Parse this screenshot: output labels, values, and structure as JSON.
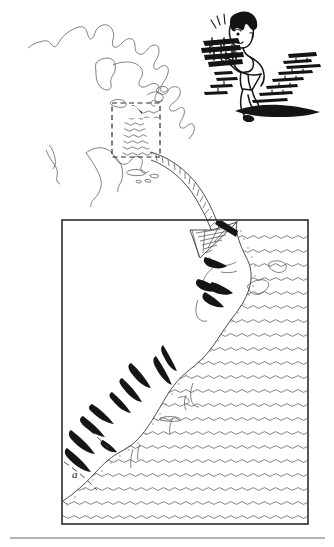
{
  "figure": {
    "kind": "scientific-illustration",
    "background_color": "#ffffff",
    "ink_color": "#2b2b2b",
    "width": 334,
    "height": 547
  },
  "overview_map": {
    "name": "north-america-outline-map",
    "description": "Outline map of North America",
    "inset_box": {
      "label": "",
      "style": "dashed",
      "x": 112,
      "y": 103,
      "width": 48,
      "height": 54
    },
    "ocean_hatching": "wavy-lines"
  },
  "cartoon": {
    "name": "boy-carrying-bricks",
    "description": "Cartoon boy carrying a heavy stack of bricks up a flight of steps",
    "effort_marks": 3
  },
  "arrow": {
    "name": "zoom-arrow",
    "description": "Curved hatched arrow pointing from the inset box to the detail panel",
    "fill_pattern": "hatched"
  },
  "detail_panel": {
    "name": "northeast-coast-detail-map",
    "description": "Enlarged map of the northeastern North American coastline and adjacent ocean",
    "frame": {
      "x": 62,
      "y": 220,
      "width": 246,
      "height": 304
    },
    "ocean_pattern": "scalloped-waves",
    "labels": [
      {
        "id": "a",
        "text": "a",
        "x": 72,
        "y": 478
      }
    ]
  },
  "footer_rule": {
    "name": "horizontal-divider",
    "x1": 10,
    "y1": 538,
    "x2": 325,
    "y2": 538
  }
}
